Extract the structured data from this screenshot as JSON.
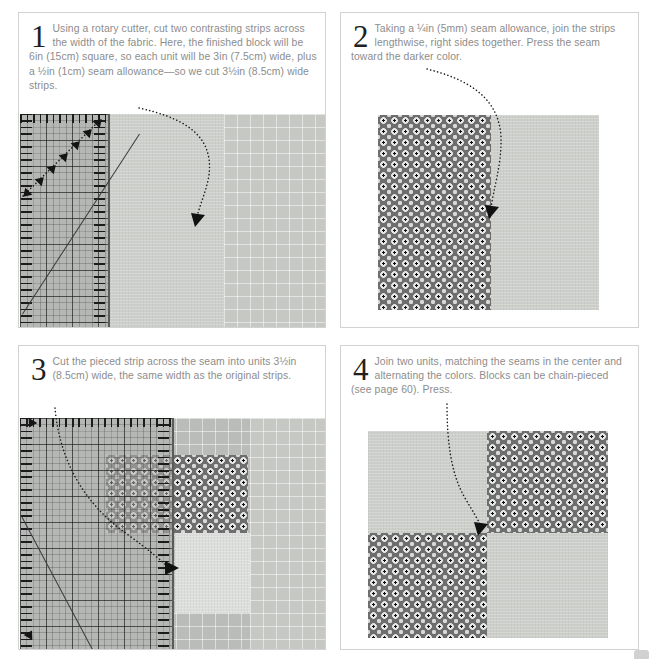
{
  "page": {
    "background_color": "#ffffff",
    "panel_border_color": "#d2d2d2",
    "body_text_color": "#8d8d8d",
    "step_number_color": "#231f20"
  },
  "steps": [
    {
      "number": "1",
      "text": "Using a rotary cutter, cut two contrasting strips across the width of the fabric. Here, the finished block will be 6in (15cm) square, so each unit will be 3in (7.5cm) wide, plus a ½in (1cm) seam allowance—so we cut 3½in (8.5cm) wide strips.",
      "photo_caption": "rotary-cutting ruler laid over two fabric strips on a green cutting mat"
    },
    {
      "number": "2",
      "text": "Taking a ¼in (5mm) seam allowance, join the strips lengthwise, right sides together. Press the seam toward the darker color.",
      "photo_caption": "patterned strip joined to plain strip, seam pressed toward the darker color"
    },
    {
      "number": "3",
      "text": "Cut the pieced strip across the seam into units 3½in (8.5cm) wide, the same width as the original strips.",
      "photo_caption": "ruler positioned across the pieced strip ready to cut 3½in units"
    },
    {
      "number": "4",
      "text": "Join two units, matching the seams in the center and alternating the colors. Blocks can be chain-pieced (see page 60). Press.",
      "photo_caption": "finished four-patch block with alternating plain and patterned squares"
    }
  ],
  "colors": {
    "cutting_mat": "#b9bcb8",
    "fabric_light": "#cdcfcb",
    "fabric_light_pale": "#dcdedb",
    "fabric_print_ground": "#6e6e6e",
    "fabric_print_motif": "#e6e6e6",
    "ruler_edge": "#5a5c59",
    "arrow": "#1c1c1c"
  }
}
